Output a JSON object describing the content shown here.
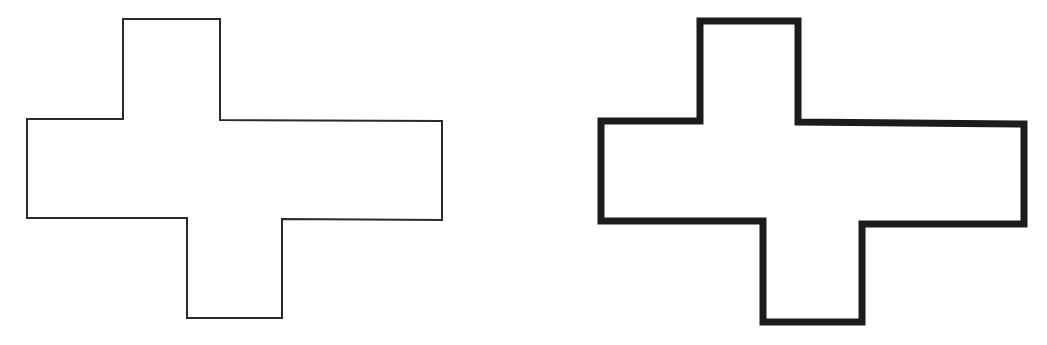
{
  "diagram": {
    "background": "#ffffff",
    "shapes": [
      {
        "id": "cross-thin",
        "description": "Cross-shaped polygon with thin outline",
        "stroke_color": "#2a2a2a",
        "stroke_width": 2,
        "points": "123,19 220,19 220,120 442,121 442,220 282,219 282,318 187,318 187,218 27,218 27,119 123,119"
      },
      {
        "id": "cross-thick",
        "description": "Same cross-shaped polygon with thick outline",
        "stroke_color": "#1c1c1c",
        "stroke_width": 7,
        "points": "700,21 798,21 798,122 1024,124 1024,224 862,224 862,322 763,322 763,221 601,221 601,121 700,121"
      }
    ]
  }
}
